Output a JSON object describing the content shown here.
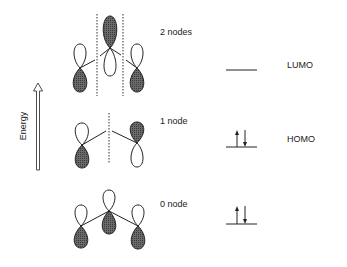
{
  "axis": {
    "label": "Energy"
  },
  "rows": [
    {
      "node_label": "2 nodes",
      "level_label": "LUMO",
      "electrons": 0
    },
    {
      "node_label": "1 node",
      "level_label": "HOMO",
      "electrons": 2
    },
    {
      "node_label": "0 node",
      "level_label": "",
      "electrons": 2
    }
  ],
  "colors": {
    "ink": "#222222",
    "shaded": "#555555",
    "background": "#ffffff"
  }
}
